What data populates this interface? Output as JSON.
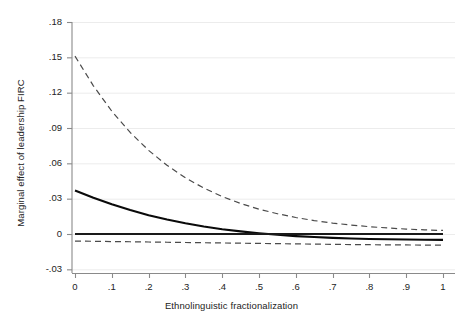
{
  "chart_data": {
    "type": "line",
    "title": "",
    "xlabel": "Ethnolinguistic fractionalization",
    "ylabel": "Marginal effect of leadership FIRC",
    "xlim": [
      0,
      1
    ],
    "ylim": [
      -0.03,
      0.18
    ],
    "grid": true,
    "legend": "none",
    "xticks": [
      "0",
      ".1",
      ".2",
      ".3",
      ".4",
      ".5",
      ".6",
      ".7",
      ".8",
      ".9",
      "1"
    ],
    "xtick_values": [
      0,
      0.1,
      0.2,
      0.3,
      0.4,
      0.5,
      0.6,
      0.7,
      0.8,
      0.9,
      1
    ],
    "yticks": [
      ".18",
      ".15",
      ".12",
      ".09",
      ".06",
      ".03",
      "0",
      "-.03"
    ],
    "ytick_values": [
      0.18,
      0.15,
      0.12,
      0.09,
      0.06,
      0.03,
      0,
      -0.03
    ],
    "x": [
      0,
      0.05,
      0.1,
      0.15,
      0.2,
      0.25,
      0.3,
      0.35,
      0.4,
      0.45,
      0.5,
      0.55,
      0.6,
      0.65,
      0.7,
      0.75,
      0.8,
      0.85,
      0.9,
      0.95,
      1
    ],
    "series": [
      {
        "name": "Marginal effect",
        "style": "solid",
        "color": "#0a0a0a",
        "width": 2.1,
        "values": [
          0.037,
          0.0308,
          0.0252,
          0.0203,
          0.016,
          0.0123,
          0.0091,
          0.0064,
          0.0041,
          0.0022,
          0.0006,
          -0.0007,
          -0.0018,
          -0.0026,
          -0.0033,
          -0.0038,
          -0.0042,
          -0.0045,
          -0.0047,
          -0.0049,
          -0.005
        ]
      },
      {
        "name": "Upper 95% confidence bound",
        "style": "dashed",
        "color": "#4a4a4a",
        "width": 1.2,
        "values": [
          0.151,
          0.1258,
          0.1043,
          0.0862,
          0.071,
          0.0583,
          0.0477,
          0.039,
          0.0318,
          0.0259,
          0.0211,
          0.0172,
          0.014,
          0.0114,
          0.0093,
          0.0076,
          0.0062,
          0.0051,
          0.0042,
          0.0035,
          0.003
        ]
      },
      {
        "name": "Lower 95% confidence bound",
        "style": "dashed",
        "color": "#4a4a4a",
        "width": 1.2,
        "values": [
          -0.006,
          -0.0062,
          -0.0064,
          -0.0066,
          -0.0068,
          -0.007,
          -0.0072,
          -0.0074,
          -0.0076,
          -0.0078,
          -0.008,
          -0.0082,
          -0.0084,
          -0.0086,
          -0.0088,
          -0.009,
          -0.0091,
          -0.0092,
          -0.0093,
          -0.0094,
          -0.0095
        ]
      },
      {
        "name": "Zero reference line",
        "style": "solid",
        "color": "#1a1a1a",
        "width": 1.8,
        "values": [
          0,
          0,
          0,
          0,
          0,
          0,
          0,
          0,
          0,
          0,
          0,
          0,
          0,
          0,
          0,
          0,
          0,
          0,
          0,
          0,
          0
        ]
      }
    ]
  },
  "axes": {
    "x_title": "Ethnolinguistic fractionalization",
    "y_title": "Marginal effect of leadership FIRC"
  },
  "colors": {
    "background": "#ffffff",
    "axis": "#8a8a8a",
    "gridline": "#ececec",
    "estimate": "#0a0a0a",
    "confidence": "#4a4a4a",
    "text": "#232323"
  }
}
